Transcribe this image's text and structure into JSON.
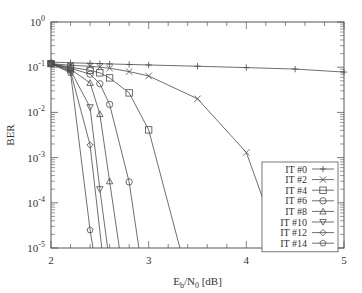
{
  "chart_data": {
    "type": "line",
    "title": "",
    "xlabel": "E_b/N_0 [dB]",
    "xlabel_parts": {
      "main1": "E",
      "sub1": "b",
      "main2": "/N",
      "sub2": "0",
      "tail": " [dB]"
    },
    "ylabel": "BER",
    "xlim": [
      2,
      5
    ],
    "ylim": [
      1e-05,
      1
    ],
    "yscale": "log",
    "grid": false,
    "legend_position": "lower right",
    "x_ticks": [
      2,
      3,
      4,
      5
    ],
    "x_tick_labels": [
      "2",
      "3",
      "4",
      "5"
    ],
    "y_ticks": [
      1,
      0.1,
      0.01,
      0.001,
      0.0001,
      1e-05
    ],
    "y_tick_labels": [
      [
        "10",
        "0"
      ],
      [
        "10",
        "-1"
      ],
      [
        "10",
        "-2"
      ],
      [
        "10",
        "-3"
      ],
      [
        "10",
        "-4"
      ],
      [
        "10",
        "-5"
      ]
    ],
    "series": [
      {
        "name": "IT #0",
        "marker": "plus",
        "x": [
          2.0,
          2.2,
          2.4,
          2.5,
          2.6,
          2.8,
          3.0,
          3.5,
          4.0,
          4.5,
          5.0
        ],
        "y": [
          0.13,
          0.125,
          0.122,
          0.12,
          0.118,
          0.115,
          0.112,
          0.105,
          0.098,
          0.091,
          0.078
        ]
      },
      {
        "name": "IT #2",
        "marker": "cross",
        "x": [
          2.0,
          2.2,
          2.4,
          2.5,
          2.6,
          2.8,
          3.0,
          3.5,
          4.0,
          4.35
        ],
        "y": [
          0.12,
          0.11,
          0.105,
          0.1,
          0.095,
          0.08,
          0.064,
          0.02,
          0.0013,
          1e-05
        ]
      },
      {
        "name": "IT #4",
        "marker": "square",
        "x": [
          2.0,
          2.2,
          2.4,
          2.5,
          2.6,
          2.8,
          3.0,
          3.32
        ],
        "y": [
          0.12,
          0.1,
          0.085,
          0.075,
          0.058,
          0.027,
          0.0041,
          1e-05
        ]
      },
      {
        "name": "IT #6",
        "marker": "circle",
        "x": [
          2.0,
          2.2,
          2.4,
          2.5,
          2.6,
          2.8,
          2.9
        ],
        "y": [
          0.12,
          0.095,
          0.07,
          0.043,
          0.015,
          0.00029,
          1e-05
        ]
      },
      {
        "name": "IT #8",
        "marker": "triangle-up",
        "x": [
          2.0,
          2.2,
          2.4,
          2.5,
          2.6,
          2.7
        ],
        "y": [
          0.12,
          0.09,
          0.045,
          0.0092,
          0.0003,
          1e-05
        ]
      },
      {
        "name": "IT #10",
        "marker": "triangle-down",
        "x": [
          2.0,
          2.2,
          2.4,
          2.5,
          2.58
        ],
        "y": [
          0.12,
          0.085,
          0.013,
          0.0002,
          1e-05
        ]
      },
      {
        "name": "IT #12",
        "marker": "diamond",
        "x": [
          2.0,
          2.2,
          2.4,
          2.52
        ],
        "y": [
          0.12,
          0.08,
          0.0019,
          1e-05
        ]
      },
      {
        "name": "IT #14",
        "marker": "pentagon",
        "x": [
          2.0,
          2.2,
          2.4,
          2.43
        ],
        "y": [
          0.12,
          0.075,
          2.5e-05,
          1e-05
        ]
      }
    ]
  },
  "colors": {
    "line": "#4a4a4a",
    "axis": "#555555",
    "text": "#333333",
    "background": "#ffffff"
  }
}
